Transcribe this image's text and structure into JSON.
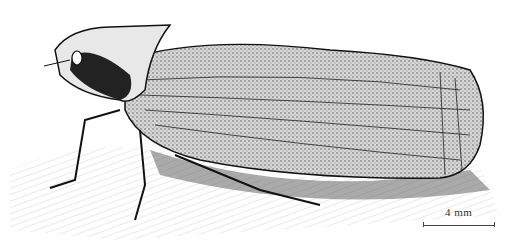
{
  "figure": {
    "view": "lateral",
    "style": "pen-and-ink stipple drawing",
    "colors": {
      "ink": "#1a1a1a",
      "paper": "#ffffff",
      "shade": "#9a9a9a"
    }
  },
  "scale_bar": {
    "label": "4 mm"
  }
}
